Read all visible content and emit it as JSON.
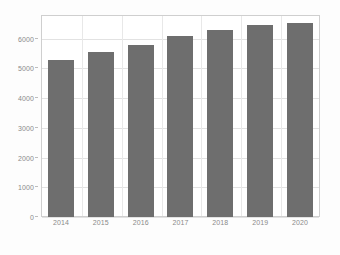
{
  "chart_data": {
    "type": "bar",
    "title": "",
    "subtitle": "",
    "xlabel": "",
    "ylabel": "",
    "categories": [
      "2014",
      "2015",
      "2016",
      "2017",
      "2018",
      "2019",
      "2020"
    ],
    "values": [
      5300,
      5550,
      5800,
      6100,
      6300,
      6450,
      6530
    ],
    "series": [
      {
        "name": "",
        "values": [
          5300,
          5550,
          5800,
          6100,
          6300,
          6450,
          6530
        ]
      }
    ],
    "ylim": [
      0,
      6800
    ],
    "yticks": [
      0,
      1000,
      2000,
      3000,
      4000,
      5000,
      6000
    ],
    "ytick_labels": [
      "0",
      "1000",
      "2000",
      "3000",
      "4000",
      "5000",
      "6000"
    ],
    "xtick_labels": [
      "2014",
      "2015",
      "2016",
      "2017",
      "2018",
      "2019",
      "2020"
    ],
    "grid": true,
    "grid_axis": "both",
    "legend": false,
    "legend_position": "none",
    "bar_color": "#6e6e6e",
    "grid_color": "#e2e2e2",
    "axis_color": "#cfcfcf",
    "tick_label_color": "#8a8a8a",
    "background_color": "#ffffff"
  }
}
